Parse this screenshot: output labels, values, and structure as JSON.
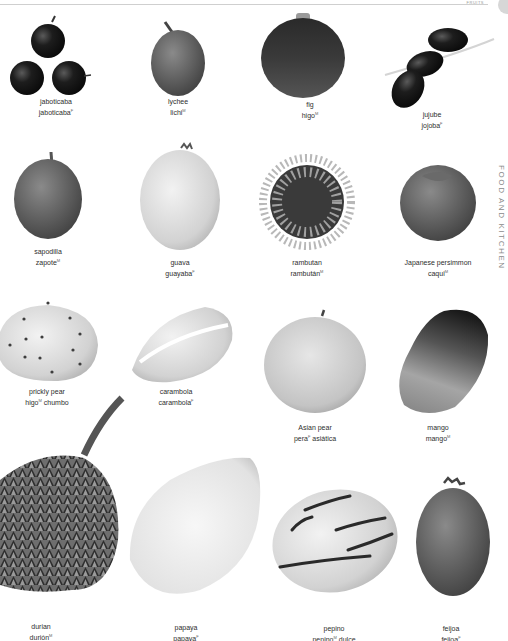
{
  "header": {
    "running_title": "FRUITS",
    "section_label": "FOOD AND KITCHEN"
  },
  "gender_markers": {
    "M": "masculine",
    "F": "feminine"
  },
  "colors": {
    "label_text": "#2e2e2e",
    "rule": "#cfcfcf",
    "section_label": "#8a8a8a",
    "tab": "#d7d7d7"
  },
  "fruits": [
    {
      "en": "jaboticaba",
      "es": "jaboticaba",
      "gender": "F",
      "es_suffix": ""
    },
    {
      "en": "lychee",
      "es": "lichi",
      "gender": "M",
      "es_suffix": ""
    },
    {
      "en": "fig",
      "es": "higo",
      "gender": "M",
      "es_suffix": ""
    },
    {
      "en": "jujube",
      "es": "jojoba",
      "gender": "F",
      "es_suffix": ""
    },
    {
      "en": "sapodilla",
      "es": "zapote",
      "gender": "M",
      "es_suffix": ""
    },
    {
      "en": "guava",
      "es": "guayaba",
      "gender": "F",
      "es_suffix": ""
    },
    {
      "en": "rambutan",
      "es": "rambután",
      "gender": "M",
      "es_suffix": ""
    },
    {
      "en": "Japanese persimmon",
      "es": "caqui",
      "gender": "M",
      "es_suffix": ""
    },
    {
      "en": "prickly pear",
      "es": "higo",
      "gender": "M",
      "es_suffix": "chumbo"
    },
    {
      "en": "carambola",
      "es": "carambola",
      "gender": "F",
      "es_suffix": ""
    },
    {
      "en": "Asian pear",
      "es": "pera",
      "gender": "F",
      "es_suffix": "asiática"
    },
    {
      "en": "mango",
      "es": "mango",
      "gender": "M",
      "es_suffix": ""
    },
    {
      "en": "durian",
      "es": "durión",
      "gender": "M",
      "es_suffix": ""
    },
    {
      "en": "papaya",
      "es": "papaya",
      "gender": "F",
      "es_suffix": ""
    },
    {
      "en": "pepino",
      "es": "pepino",
      "gender": "M",
      "es_suffix": "dulce"
    },
    {
      "en": "feijoa",
      "es": "feijoa",
      "gender": "F",
      "es_suffix": ""
    }
  ]
}
